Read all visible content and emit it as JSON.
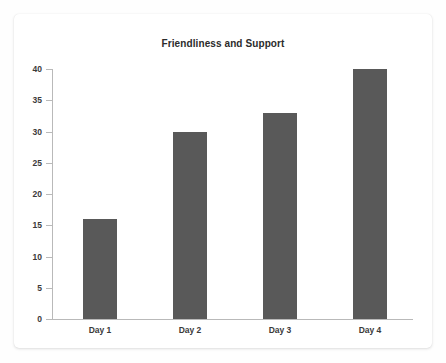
{
  "card": {
    "background": "#ffffff"
  },
  "chart_data": {
    "type": "bar",
    "title": "Friendliness and Support",
    "xlabel": "",
    "ylabel": "",
    "categories": [
      "Day 1",
      "Day 2",
      "Day 3",
      "Day 4"
    ],
    "values": [
      16,
      30,
      33,
      40
    ],
    "series": [
      {
        "name": "Friendliness and Support",
        "values": [
          16,
          30,
          33,
          40
        ]
      }
    ],
    "ylim": [
      0,
      40
    ],
    "yticks": [
      0,
      5,
      10,
      15,
      20,
      25,
      30,
      35,
      40
    ],
    "ytick_labels": [
      "0",
      "5",
      "10",
      "15",
      "20",
      "25",
      "30",
      "35",
      "40"
    ],
    "grid": false,
    "legend": false,
    "bar_color": "#595959",
    "axis_color": "#b9b9b9",
    "text_color": "#3a3a3a",
    "title_color": "#2b2b2b"
  }
}
